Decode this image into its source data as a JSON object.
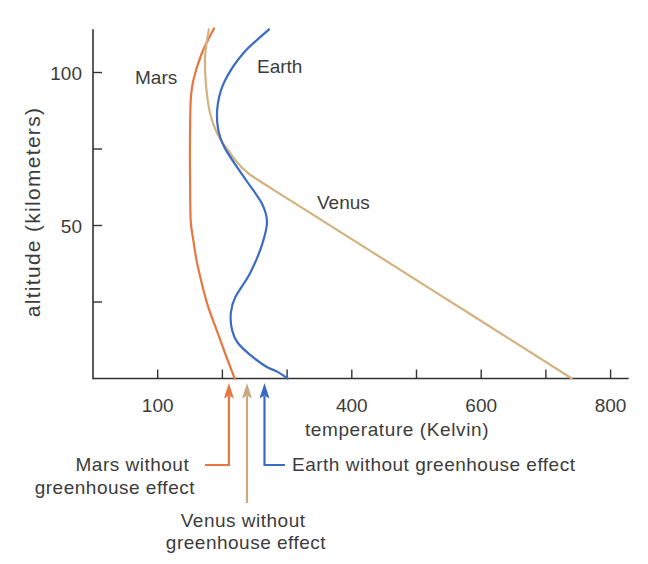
{
  "chart_data": {
    "type": "line",
    "title": "",
    "xlabel": "temperature (Kelvin)",
    "ylabel": "altitude (kilometers)",
    "xlim": [
      0,
      828
    ],
    "ylim": [
      0,
      114
    ],
    "grid": false,
    "legend": "none (inline series labels)",
    "x_ticks": [
      {
        "value": 100,
        "label": "100"
      },
      {
        "value": 200,
        "label": ""
      },
      {
        "value": 300,
        "label": ""
      },
      {
        "value": 400,
        "label": "400"
      },
      {
        "value": 500,
        "label": ""
      },
      {
        "value": 600,
        "label": "600"
      },
      {
        "value": 700,
        "label": ""
      },
      {
        "value": 800,
        "label": "800"
      }
    ],
    "y_ticks": [
      {
        "value": 25,
        "label": ""
      },
      {
        "value": 50,
        "label": "50"
      },
      {
        "value": 75,
        "label": ""
      },
      {
        "value": 100,
        "label": "100"
      }
    ],
    "point_format": "[temperature_K, altitude_km]",
    "series": [
      {
        "name": "Mars",
        "color": "#e8773f",
        "points": [
          [
            187,
            114.4
          ],
          [
            168,
            106.2
          ],
          [
            155,
            97.4
          ],
          [
            151,
            90.8
          ],
          [
            150,
            81.0
          ],
          [
            150,
            64.7
          ],
          [
            151,
            51.6
          ],
          [
            155,
            45.3
          ],
          [
            160,
            38.7
          ],
          [
            168,
            31.2
          ],
          [
            178,
            23.4
          ],
          [
            191,
            15.9
          ],
          [
            204,
            8.3
          ],
          [
            219,
            0
          ]
        ]
      },
      {
        "name": "Venus",
        "color": "#d4b27f",
        "points": [
          [
            179,
            114.1
          ],
          [
            175,
            108.8
          ],
          [
            173,
            103.9
          ],
          [
            175,
            95.1
          ],
          [
            181,
            86.6
          ],
          [
            192,
            80.1
          ],
          [
            209,
            74.5
          ],
          [
            235,
            68.0
          ],
          [
            281,
            61.4
          ],
          [
            511,
            30.7
          ],
          [
            740,
            0
          ]
        ]
      },
      {
        "name": "Earth",
        "color": "#3a6cc5",
        "points": [
          [
            272,
            114.1
          ],
          [
            232,
            106.2
          ],
          [
            204,
            97.4
          ],
          [
            193,
            89.9
          ],
          [
            193,
            82.0
          ],
          [
            204,
            75.2
          ],
          [
            237,
            64.7
          ],
          [
            261,
            57.2
          ],
          [
            269,
            51.1
          ],
          [
            261,
            43.6
          ],
          [
            243,
            34.5
          ],
          [
            220,
            26.6
          ],
          [
            213,
            21.4
          ],
          [
            215,
            15.8
          ],
          [
            224,
            11.6
          ],
          [
            243,
            7.7
          ],
          [
            266,
            4.1
          ],
          [
            286,
            2.1
          ],
          [
            301,
            0
          ]
        ]
      }
    ],
    "annotations": [
      {
        "planet": "Mars",
        "temperature": 210,
        "color": "#e8773f",
        "text_lines": [
          "Mars without",
          "greenhouse effect"
        ]
      },
      {
        "planet": "Venus",
        "temperature": 238,
        "color": "#c9aa80",
        "text_lines": [
          "Venus without",
          "greenhouse effect"
        ]
      },
      {
        "planet": "Earth",
        "temperature": 265,
        "color": "#3a6cc5",
        "text_lines": [
          "Earth without greenhouse effect"
        ]
      }
    ]
  }
}
